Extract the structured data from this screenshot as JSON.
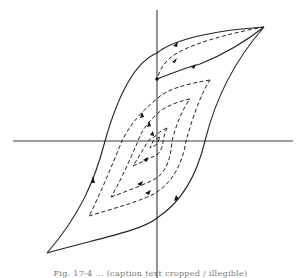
{
  "figure": {
    "type": "hysteresis-loop-diagram",
    "caption": "Fig. 17-4 ... (caption text cropped / illegible)"
  },
  "axes": {
    "origin": [
      157,
      141
    ],
    "vertical": {
      "x": 157,
      "y_top": 10,
      "y_bottom": 278
    },
    "horizontal": {
      "y": 141,
      "x_left": 13,
      "x_right": 293
    }
  },
  "loops": {
    "outer": {
      "style": "solid",
      "upper_tip": [
        264,
        27
      ],
      "lower_tip": [
        47,
        253
      ]
    },
    "minor": [
      {
        "style": "dashed",
        "upper_tip": [
          210,
          80
        ],
        "lower_tip": [
          89,
          216
        ]
      },
      {
        "style": "dashed",
        "upper_tip": [
          190,
          99
        ],
        "lower_tip": [
          111,
          197
        ]
      },
      {
        "style": "dashed",
        "upper_tip": [
          167,
          128
        ],
        "lower_tip": [
          133,
          166
        ]
      },
      {
        "style": "dashed",
        "upper_tip": [
          160,
          137
        ],
        "lower_tip": [
          150,
          148
        ]
      }
    ]
  },
  "colors": {
    "line": "#222222",
    "axis": "#3a3a3a",
    "background": "#ffffff"
  }
}
